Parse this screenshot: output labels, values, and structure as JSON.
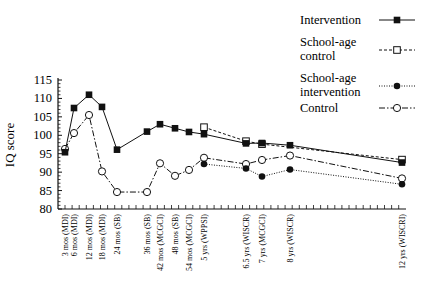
{
  "chart_data": {
    "type": "line",
    "title": "",
    "xlabel": "",
    "ylabel": "IQ score",
    "ylim": [
      80,
      115
    ],
    "yticks": [
      80,
      85,
      90,
      95,
      100,
      105,
      110,
      115
    ],
    "grid": false,
    "legend_position": "top-right",
    "categories": [
      "3 mos (MDI)",
      "6 mos (MDI)",
      "12 mos (MDI)",
      "18 mos (MDI)",
      "24 mos (SB)",
      "36 mos (SB)",
      "42 mos (MCGCI)",
      "48 mos (SB)",
      "54 mos (MCGCI)",
      "5 yrs (WPPSI)",
      "6.5 yrs (WISCR)",
      "7 yrs (MCGCI)",
      "8 yrs (WISCR)",
      "12 yrs (WISCRI)"
    ],
    "x_months": [
      3,
      6,
      12,
      18,
      24,
      36,
      42,
      48,
      54,
      60,
      78,
      84,
      96,
      144
    ],
    "series": [
      {
        "name": "Intervention",
        "style": "solid",
        "marker": "filled-square",
        "values": [
          95.4,
          107.4,
          111.0,
          107.7,
          96.1,
          101.0,
          103.0,
          101.9,
          100.9,
          100.3,
          97.8,
          97.9,
          97.3,
          92.6
        ]
      },
      {
        "name": "School-age control",
        "style": "dashed",
        "marker": "open-square",
        "values": [
          null,
          null,
          null,
          null,
          null,
          null,
          null,
          null,
          null,
          102.2,
          98.4,
          97.6,
          null,
          93.4
        ]
      },
      {
        "name": "School-age intervention",
        "style": "dotted",
        "marker": "filled-circle",
        "values": [
          null,
          null,
          null,
          null,
          null,
          null,
          null,
          null,
          null,
          92.2,
          91.0,
          88.8,
          90.7,
          86.7
        ]
      },
      {
        "name": "Control",
        "style": "dash-dot",
        "marker": "open-circle",
        "values": [
          96.3,
          100.6,
          105.5,
          90.2,
          84.6,
          84.6,
          92.4,
          89.0,
          90.6,
          93.9,
          92.2,
          93.3,
          94.5,
          88.3
        ]
      }
    ]
  },
  "legend": {
    "items": [
      {
        "label_lines": [
          "Intervention"
        ]
      },
      {
        "label_lines": [
          "School-age",
          "control"
        ]
      },
      {
        "label_lines": [
          "School-age",
          "intervention"
        ]
      },
      {
        "label_lines": [
          "Control"
        ]
      }
    ]
  },
  "axis": {
    "y_title": "IQ score",
    "y_tick_labels": [
      "80",
      "85",
      "90",
      "95",
      "100",
      "105",
      "110",
      "115"
    ]
  }
}
